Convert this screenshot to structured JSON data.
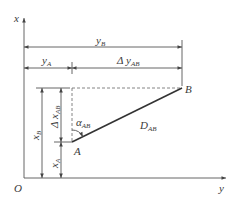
{
  "diagram": {
    "axes": {
      "vertical_label": "x",
      "horizontal_label": "y",
      "origin_label": "O"
    },
    "points": {
      "A": {
        "label": "A",
        "px": [
          72,
          142
        ]
      },
      "B": {
        "label": "B",
        "px": [
          182,
          88
        ]
      }
    },
    "segment": {
      "label_main": "D",
      "label_sub": "AB"
    },
    "angle": {
      "label_main": "α",
      "label_sub": "AB"
    },
    "dimensions": {
      "yB": {
        "main": "y",
        "sub": "B"
      },
      "yA": {
        "main": "y",
        "sub": "A"
      },
      "dyAB": {
        "main": "Δ y",
        "sub": "AB"
      },
      "xB": {
        "main": "x",
        "sub": "B"
      },
      "xA": {
        "main": "x",
        "sub": "A"
      },
      "dxAB": {
        "main": "Δ x",
        "sub": "AB"
      }
    },
    "colors": {
      "line": "#555555",
      "segment": "#333333",
      "text": "#3a3a3a"
    }
  }
}
